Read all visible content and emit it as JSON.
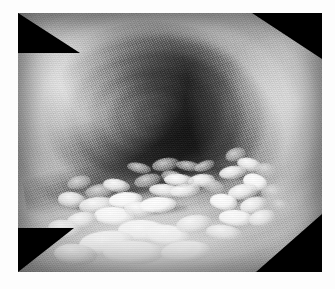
{
  "page": {
    "background_color": "#fdfdfd",
    "width": 335,
    "height": 289
  },
  "photo": {
    "caption": "",
    "alt_description": "Grayscale endoscopic photograph of the esophagus",
    "modality": "endoscopy",
    "color_mode": "grayscale",
    "frame": {
      "left": 18,
      "top": 13,
      "width": 304,
      "height": 259,
      "border_color": "#ffffff",
      "background_color": "#000000"
    },
    "regions": [
      {
        "name": "lumen",
        "label": "dark central lumen",
        "center_x_pct": 45,
        "center_y_pct": 40,
        "tone": "#0a0a0a"
      },
      {
        "name": "fold-upper-left",
        "label": "bright mucosal fold upper left",
        "tone": "#eeeeee"
      },
      {
        "name": "fold-upper-right",
        "label": "bright mucosal fold upper right",
        "tone": "#e2e2e2"
      },
      {
        "name": "fold-lower",
        "label": "bright mucosal shelf lower",
        "tone": "#f4f4f4"
      },
      {
        "name": "plaque-field-lower-left",
        "label": "white plaque cluster lower left",
        "tone": "#ffffff"
      },
      {
        "name": "plaque-field-right",
        "label": "white plaque cluster right",
        "tone": "#f8f8f8"
      }
    ],
    "texture": {
      "name": "fiber-optic crosshatch moire",
      "visible": true
    },
    "corner_vignettes": [
      "top-left",
      "top-right",
      "bottom-left",
      "bottom-right"
    ]
  },
  "plaques": {
    "lower_left": [
      {
        "x": 16,
        "y": 63,
        "w": 8,
        "h": 5,
        "r": -14,
        "v": "dim"
      },
      {
        "x": 22,
        "y": 66,
        "w": 10,
        "h": 5,
        "r": -10,
        "v": "dim"
      },
      {
        "x": 13,
        "y": 69,
        "w": 9,
        "h": 6,
        "r": 6,
        "v": ""
      },
      {
        "x": 20,
        "y": 71,
        "w": 12,
        "h": 6,
        "r": -6,
        "v": ""
      },
      {
        "x": 28,
        "y": 64,
        "w": 9,
        "h": 5,
        "r": 10,
        "v": ""
      },
      {
        "x": 30,
        "y": 69,
        "w": 11,
        "h": 6,
        "r": -4,
        "v": "bright"
      },
      {
        "x": 25,
        "y": 75,
        "w": 13,
        "h": 7,
        "r": 3,
        "v": "bright"
      },
      {
        "x": 16,
        "y": 77,
        "w": 10,
        "h": 6,
        "r": -9,
        "v": ""
      },
      {
        "x": 35,
        "y": 73,
        "w": 10,
        "h": 6,
        "r": 8,
        "v": ""
      },
      {
        "x": 38,
        "y": 62,
        "w": 9,
        "h": 5,
        "r": -12,
        "v": "dim"
      },
      {
        "x": 43,
        "y": 66,
        "w": 11,
        "h": 5,
        "r": 5,
        "v": ""
      },
      {
        "x": 40,
        "y": 71,
        "w": 12,
        "h": 6,
        "r": -3,
        "v": "bright"
      },
      {
        "x": 47,
        "y": 61,
        "w": 8,
        "h": 5,
        "r": 14,
        "v": "dim"
      },
      {
        "x": 50,
        "y": 66,
        "w": 10,
        "h": 5,
        "r": -7,
        "v": ""
      },
      {
        "x": 33,
        "y": 80,
        "w": 16,
        "h": 8,
        "r": 2,
        "v": "bright"
      },
      {
        "x": 20,
        "y": 84,
        "w": 18,
        "h": 9,
        "r": -5,
        "v": "bright"
      },
      {
        "x": 42,
        "y": 82,
        "w": 14,
        "h": 8,
        "r": 6,
        "v": "bright"
      },
      {
        "x": 10,
        "y": 80,
        "w": 11,
        "h": 7,
        "r": 8,
        "v": ""
      },
      {
        "x": 52,
        "y": 78,
        "w": 12,
        "h": 7,
        "r": -8,
        "v": ""
      },
      {
        "x": 28,
        "y": 88,
        "w": 20,
        "h": 9,
        "r": 1,
        "v": "bright"
      },
      {
        "x": 47,
        "y": 88,
        "w": 16,
        "h": 8,
        "r": -4,
        "v": "bright"
      },
      {
        "x": 12,
        "y": 89,
        "w": 14,
        "h": 8,
        "r": 5,
        "v": ""
      }
    ],
    "right": [
      {
        "x": 68,
        "y": 52,
        "w": 7,
        "h": 5,
        "r": -18,
        "v": "dim"
      },
      {
        "x": 72,
        "y": 56,
        "w": 8,
        "h": 5,
        "r": 12,
        "v": ""
      },
      {
        "x": 66,
        "y": 59,
        "w": 9,
        "h": 5,
        "r": -8,
        "v": ""
      },
      {
        "x": 74,
        "y": 62,
        "w": 8,
        "h": 6,
        "r": 16,
        "v": "bright"
      },
      {
        "x": 69,
        "y": 66,
        "w": 10,
        "h": 6,
        "r": -10,
        "v": ""
      },
      {
        "x": 78,
        "y": 58,
        "w": 7,
        "h": 5,
        "r": 6,
        "v": "dim"
      },
      {
        "x": 63,
        "y": 70,
        "w": 9,
        "h": 6,
        "r": 9,
        "v": "bright"
      },
      {
        "x": 73,
        "y": 71,
        "w": 9,
        "h": 6,
        "r": -14,
        "v": ""
      },
      {
        "x": 60,
        "y": 64,
        "w": 8,
        "h": 5,
        "r": 18,
        "v": "dim"
      },
      {
        "x": 80,
        "y": 66,
        "w": 8,
        "h": 6,
        "r": -6,
        "v": "dim"
      },
      {
        "x": 66,
        "y": 76,
        "w": 11,
        "h": 6,
        "r": 4,
        "v": "bright"
      },
      {
        "x": 76,
        "y": 76,
        "w": 9,
        "h": 6,
        "r": -12,
        "v": ""
      },
      {
        "x": 58,
        "y": 57,
        "w": 7,
        "h": 4,
        "r": -20,
        "v": "dim"
      },
      {
        "x": 62,
        "y": 82,
        "w": 12,
        "h": 6,
        "r": 7,
        "v": ""
      },
      {
        "x": 83,
        "y": 72,
        "w": 7,
        "h": 5,
        "r": 10,
        "v": "dim"
      }
    ],
    "mid": [
      {
        "x": 44,
        "y": 56,
        "w": 9,
        "h": 5,
        "r": -10,
        "v": "dim"
      },
      {
        "x": 52,
        "y": 57,
        "w": 8,
        "h": 4,
        "r": 8,
        "v": "dim"
      },
      {
        "x": 36,
        "y": 58,
        "w": 8,
        "h": 4,
        "r": 12,
        "v": "dim"
      },
      {
        "x": 56,
        "y": 62,
        "w": 9,
        "h": 5,
        "r": -6,
        "v": ""
      },
      {
        "x": 48,
        "y": 62,
        "w": 10,
        "h": 5,
        "r": 4,
        "v": ""
      }
    ]
  },
  "crevices": [
    {
      "x": 24,
      "y": 67,
      "w": 22,
      "h": 4,
      "r": -8
    },
    {
      "x": 38,
      "y": 64,
      "w": 20,
      "h": 4,
      "r": 5
    },
    {
      "x": 30,
      "y": 74,
      "w": 26,
      "h": 4,
      "r": -3
    },
    {
      "x": 62,
      "y": 60,
      "w": 16,
      "h": 4,
      "r": 14
    },
    {
      "x": 66,
      "y": 69,
      "w": 18,
      "h": 4,
      "r": -10
    },
    {
      "x": 14,
      "y": 73,
      "w": 18,
      "h": 4,
      "r": 9
    },
    {
      "x": 46,
      "y": 59,
      "w": 22,
      "h": 3,
      "r": -5
    }
  ]
}
